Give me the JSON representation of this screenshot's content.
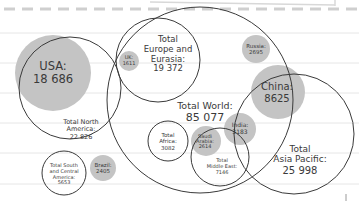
{
  "colors": {
    "paper": "#ffffff",
    "ruled_line": "#e6e6e6",
    "dash": "#cfcfcf",
    "filled_circle": "#c4c4c4",
    "outline": "#3a3a3a",
    "text": "#3a3a3a"
  },
  "world": {
    "label": "Total World:",
    "value": "85 077"
  },
  "regions": [
    {
      "id": "north-america",
      "label": "Total North America:",
      "value": "22 826"
    },
    {
      "id": "europe-eurasia",
      "label": "Total Europe and Eurasia:",
      "value": "19 372"
    },
    {
      "id": "asia-pacific",
      "label": "Total Asia Pacific:",
      "value": "25 998"
    },
    {
      "id": "africa",
      "label": "Total Africa:",
      "value": "3082"
    },
    {
      "id": "middle-east",
      "label": "Total Middle East:",
      "value": "7146"
    },
    {
      "id": "south-central-america",
      "label": "Total South and Central America:",
      "value": "5653"
    }
  ],
  "countries": [
    {
      "id": "usa",
      "label": "USA:",
      "value": "18 686"
    },
    {
      "id": "uk",
      "label": "UK:",
      "value": "1611"
    },
    {
      "id": "russia",
      "label": "Russia:",
      "value": "2695"
    },
    {
      "id": "china",
      "label": "China:",
      "value": "8625"
    },
    {
      "id": "india",
      "label": "India:",
      "value": "3183"
    },
    {
      "id": "saudi-arabia",
      "label": "Saudi Arabia:",
      "value": "2614"
    },
    {
      "id": "brazil",
      "label": "Brazil:",
      "value": "2405"
    }
  ],
  "labels": {
    "world_1": "Total World:",
    "world_2": "85 077",
    "usa_1": "USA:",
    "usa_2": "18 686",
    "na_1": "Total North",
    "na_2": "America:",
    "na_3": "22 826",
    "eu_1": "Total",
    "eu_2": "Europe and",
    "eu_3": "Eurasia:",
    "eu_4": "19 372",
    "uk_1": "UK:",
    "uk_2": "1611",
    "ru_1": "Russia:",
    "ru_2": "2695",
    "cn_1": "China:",
    "cn_2": "8625",
    "in_1": "India:",
    "in_2": "3183",
    "ap_1": "Total",
    "ap_2": "Asia Pacific:",
    "ap_3": "25 998",
    "af_1": "Total",
    "af_2": "Africa:",
    "af_3": "3082",
    "sa_1": "Saudi",
    "sa_2": "Arabia:",
    "sa_3": "2614",
    "me_1": "Total",
    "me_2": "Middle East:",
    "me_3": "7146",
    "br_1": "Brazil:",
    "br_2": "2405",
    "sca_1": "Total South",
    "sca_2": "and Central",
    "sca_3": "America:",
    "sca_4": "5653"
  }
}
